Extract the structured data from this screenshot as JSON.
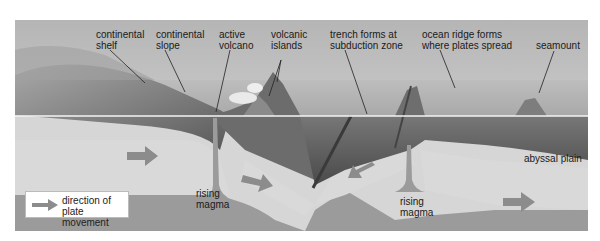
{
  "figure": {
    "top_cropped_text": "",
    "labels": {
      "continental_shelf": "continental\nshelf",
      "continental_shelf_l1": "continental",
      "continental_shelf_l2": "shelf",
      "continental_slope_l1": "continental",
      "continental_slope_l2": "slope",
      "active_volcano_l1": "active",
      "active_volcano_l2": "volcano",
      "volcanic_islands_l1": "volcanic",
      "volcanic_islands_l2": "islands",
      "trench_l1": "trench forms at",
      "trench_l2": "subduction zone",
      "ridge_l1": "ocean ridge forms",
      "ridge_l2": "where plates spread",
      "seamount": "seamount",
      "abyssal_plain": "abyssal plain",
      "rising_magma_left_l1": "rising",
      "rising_magma_left_l2": "magma",
      "rising_magma_right_l1": "rising",
      "rising_magma_right_l2": "magma"
    },
    "legend": {
      "icon": "arrow-right-icon",
      "text_l1": "direction of",
      "text_l2": "plate movement"
    },
    "plate_arrows": [
      {
        "direction": "right",
        "location": "left continental plate"
      },
      {
        "direction": "right",
        "location": "subducting plate under volcano"
      },
      {
        "direction": "left",
        "location": "oceanic plate toward trench"
      },
      {
        "direction": "right",
        "location": "oceanic plate beyond ridge"
      }
    ],
    "colors": {
      "sky": "#cfcfcf",
      "sea_surface_line": "#f2f2f2",
      "ocean_floor_dark": "#5a5a5a",
      "plate": "#d9d9d9",
      "mantle": "#9a9a9a",
      "arrow": "#8c8c8c",
      "text": "#1a1a1a"
    }
  }
}
